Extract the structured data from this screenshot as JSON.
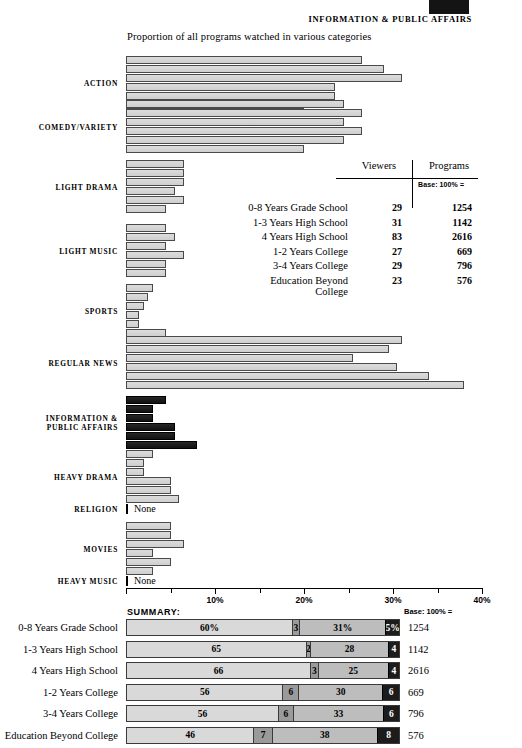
{
  "header": {
    "swatch_color": "#141414",
    "title": "INFORMATION & PUBLIC AFFAIRS",
    "subtitle": "Proportion of all programs watched in various categories"
  },
  "table": {
    "col_viewers": "Viewers",
    "col_programs": "Programs",
    "base_label": "Base: 100% =",
    "rows": [
      {
        "name": "0-8 Years Grade School",
        "viewers": "29",
        "programs": "1254"
      },
      {
        "name": "1-3 Years High School",
        "viewers": "31",
        "programs": "1142"
      },
      {
        "name": "4 Years High School",
        "viewers": "83",
        "programs": "2616"
      },
      {
        "name": "1-2 Years College",
        "viewers": "27",
        "programs": "669"
      },
      {
        "name": "3-4 Years College",
        "viewers": "29",
        "programs": "796"
      },
      {
        "name": "Education Beyond College",
        "viewers": "23",
        "programs": "576"
      }
    ]
  },
  "axis": {
    "min": 0,
    "max": 40,
    "tick_step": 5,
    "labels": [
      {
        "value": 10,
        "text": "10%"
      },
      {
        "value": 20,
        "text": "20%"
      },
      {
        "value": 30,
        "text": "30%"
      },
      {
        "value": 40,
        "text": "40%"
      }
    ]
  },
  "summary": {
    "title": "SUMMARY:",
    "base_label": "Base: 100% ="
  },
  "chart_data": {
    "type": "bar",
    "title": "Proportion of all programs watched in various categories",
    "xlabel": "",
    "ylabel": "",
    "xlim": [
      0,
      40
    ],
    "grid": false,
    "legend": "",
    "series": [
      "0-8 Years Grade School",
      "1-3 Years High School",
      "4 Years High School",
      "1-2 Years College",
      "3-4 Years College",
      "Education Beyond College"
    ],
    "categories": [
      {
        "label": "ACTION",
        "highlight": false,
        "none": false,
        "values": [
          26.5,
          29.0,
          31.0,
          23.5,
          23.5,
          20.0
        ]
      },
      {
        "label": "COMEDY/VARIETY",
        "highlight": false,
        "none": false,
        "values": [
          24.5,
          26.5,
          24.5,
          26.5,
          24.5,
          20.0
        ]
      },
      {
        "label": "LIGHT DRAMA",
        "highlight": false,
        "none": false,
        "values": [
          6.5,
          6.5,
          6.5,
          5.5,
          6.5,
          4.5
        ]
      },
      {
        "label": "LIGHT MUSIC",
        "highlight": false,
        "none": false,
        "values": [
          4.5,
          5.5,
          4.5,
          6.5,
          4.5,
          4.5
        ]
      },
      {
        "label": "SPORTS",
        "highlight": false,
        "none": false,
        "values": [
          3.0,
          2.5,
          2.0,
          1.5,
          1.5,
          4.5
        ]
      },
      {
        "label": "REGULAR NEWS",
        "highlight": false,
        "none": false,
        "values": [
          31.0,
          29.5,
          25.5,
          30.5,
          34.0,
          38.0
        ]
      },
      {
        "label": "INFORMATION &\nPUBLIC AFFAIRS",
        "highlight": true,
        "none": false,
        "values": [
          4.5,
          3.0,
          3.0,
          5.5,
          5.5,
          8.0
        ]
      },
      {
        "label": "HEAVY DRAMA",
        "highlight": false,
        "none": false,
        "values": [
          3.0,
          2.0,
          2.0,
          5.0,
          5.0,
          6.0
        ]
      },
      {
        "label": "RELIGION",
        "highlight": false,
        "none": true,
        "none_text": "None",
        "values": []
      },
      {
        "label": "MOVIES",
        "highlight": false,
        "none": false,
        "values": [
          5.0,
          5.0,
          6.5,
          3.0,
          5.0,
          3.0
        ]
      },
      {
        "label": "HEAVY MUSIC",
        "highlight": false,
        "none": true,
        "none_text": "None",
        "values": []
      }
    ],
    "summary": {
      "type": "stacked_bar",
      "segment_names": [
        "Entertainment",
        "Information & Public Affairs",
        "News",
        "Other"
      ],
      "rows": [
        {
          "name": "0-8 Years Grade School",
          "segments": [
            "60%",
            "3",
            "31%",
            "5%"
          ],
          "segment_values": [
            60,
            3,
            31,
            5
          ],
          "base": "1254"
        },
        {
          "name": "1-3 Years High School",
          "segments": [
            "65",
            "2",
            "28",
            "4"
          ],
          "segment_values": [
            65,
            2,
            28,
            4
          ],
          "base": "1142"
        },
        {
          "name": "4 Years High School",
          "segments": [
            "66",
            "3",
            "25",
            "4"
          ],
          "segment_values": [
            66,
            3,
            25,
            4
          ],
          "base": "2616"
        },
        {
          "name": "1-2 Years College",
          "segments": [
            "56",
            "6",
            "30",
            "6"
          ],
          "segment_values": [
            56,
            6,
            30,
            6
          ],
          "base": "669"
        },
        {
          "name": "3-4 Years College",
          "segments": [
            "56",
            "6",
            "33",
            "6"
          ],
          "segment_values": [
            56,
            6,
            33,
            6
          ],
          "base": "796"
        },
        {
          "name": "Education Beyond College",
          "segments": [
            "46",
            "7",
            "38",
            "8"
          ],
          "segment_values": [
            46,
            7,
            38,
            8
          ],
          "base": "576"
        }
      ]
    }
  }
}
